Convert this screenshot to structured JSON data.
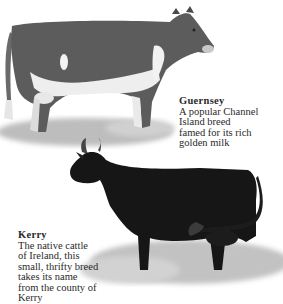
{
  "breeds": [
    {
      "name": "Guernsey",
      "description": "A popular Channel\nIsland breed\nfamed for its rich\ngolden milk",
      "body_color": "#5a5a5a",
      "markings_color": "#f2f2f2"
    },
    {
      "name": "Kerry",
      "description": "The native cattle\nof Ireland, this\nsmall, thrifty breed\ntakes its name\nfrom the county of\nKerry",
      "body_color": "#141414"
    }
  ]
}
